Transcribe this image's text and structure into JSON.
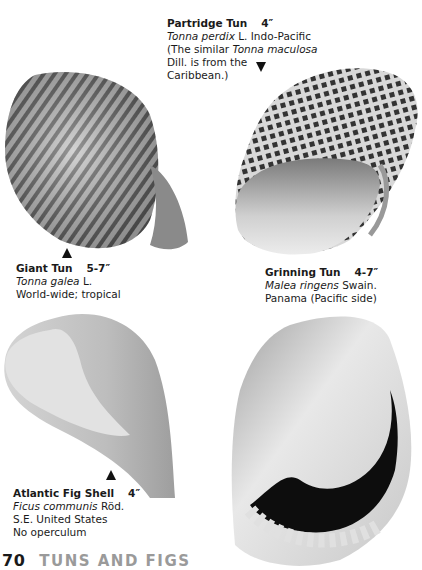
{
  "page": {
    "number": "70",
    "section_title": "TUNS AND FIGS",
    "folio_title_color": "#9a9a9a"
  },
  "shells": [
    {
      "common_name": "Partridge Tun",
      "size": "4″",
      "scientific_name": "Tonna perdix",
      "author": "L.",
      "range": "Indo-Pacific",
      "note_prefix": "(The similar ",
      "note_species": "Tonna maculosa",
      "note_line2": "Dill. is from the",
      "note_line3": "Caribbean.)",
      "pointer": "down-arrow"
    },
    {
      "common_name": "Giant Tun",
      "size": "5-7″",
      "scientific_name": "Tonna galea",
      "author": "L.",
      "range": "World-wide; tropical",
      "pointer": "up-arrow"
    },
    {
      "common_name": "Grinning Tun",
      "size": "4-7″",
      "scientific_name": "Malea ringens",
      "author": "Swain.",
      "range": "Panama (Pacific side)"
    },
    {
      "common_name": "Atlantic Fig Shell",
      "size": "4″",
      "scientific_name": "Ficus communis",
      "author": "Röd.",
      "range": "S.E. United States",
      "note": "No operculum",
      "pointer": "up-arrow"
    }
  ]
}
